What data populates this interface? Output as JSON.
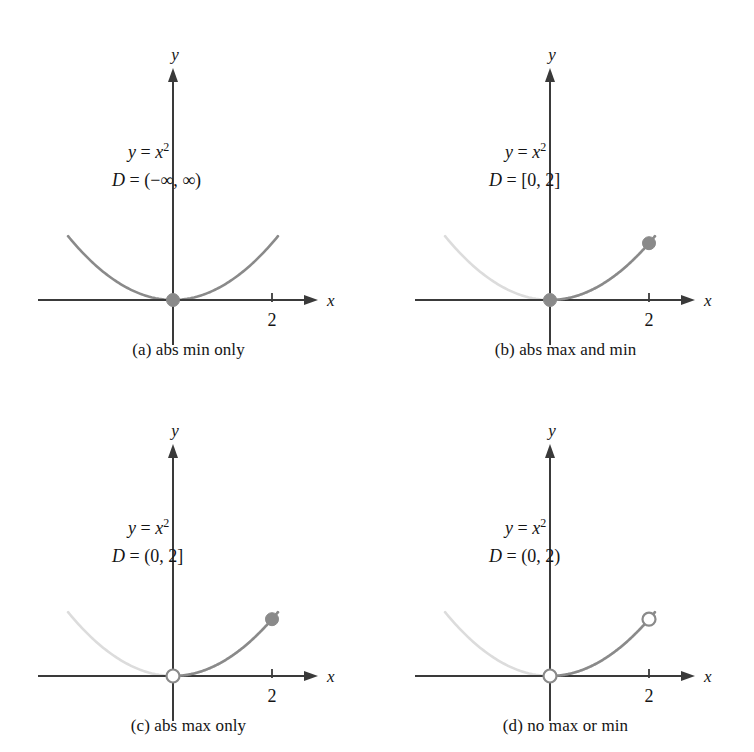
{
  "figure": {
    "columns": 2,
    "rows": 2,
    "background": "#ffffff",
    "panel_width": 377,
    "panel_height": 376
  },
  "style": {
    "curve_active_color": "#8a8a8a",
    "curve_inactive_color": "#dcdcdc",
    "axis_color": "#3a3a3a",
    "dot_fill_color": "#8a8a8a",
    "dot_open_fill": "#ffffff",
    "text_color": "#141414",
    "curve_width": 2.6,
    "axis_width": 2.0,
    "dot_radius": 6.5
  },
  "geometry": {
    "origin_x": 173,
    "origin_y": 300,
    "unit_px": 49.5,
    "y_scale_px": 14.2,
    "x_axis_left": 38,
    "x_axis_right": 318,
    "y_axis_top": 68,
    "y_axis_bottom": 345,
    "tick_x_value": 2,
    "curve_x_min": -2.12,
    "curve_x_max": 2.12
  },
  "labels": {
    "x_axis": "x",
    "y_axis": "y",
    "tick_2": "2",
    "equation_lhs": "y",
    "equation_eq": "=",
    "equation_rhs_base": "x",
    "equation_rhs_exp": "2",
    "domain_lhs": "D",
    "domain_eq": "="
  },
  "panels": [
    {
      "id": "a",
      "caption": "(a) abs min only",
      "equation": "y = x²",
      "domain_text": "(−∞, ∞)",
      "domain_start": null,
      "domain_end": null,
      "highlight_all": true,
      "markers": [
        {
          "name": "origin-min-point",
          "x": 0,
          "y": 0,
          "kind": "filled"
        }
      ]
    },
    {
      "id": "b",
      "caption": "(b) abs max and min",
      "equation": "y = x²",
      "domain_text": "[0, 2]",
      "domain_start": 0,
      "domain_end": 2,
      "highlight_all": false,
      "markers": [
        {
          "name": "origin-min-point",
          "x": 0,
          "y": 0,
          "kind": "filled"
        },
        {
          "name": "right-max-point",
          "x": 2,
          "y": 4,
          "kind": "filled"
        }
      ]
    },
    {
      "id": "c",
      "caption": "(c) abs max only",
      "equation": "y = x²",
      "domain_text": "(0, 2]",
      "domain_start": 0,
      "domain_end": 2,
      "highlight_all": false,
      "markers": [
        {
          "name": "origin-excluded-point",
          "x": 0,
          "y": 0,
          "kind": "open"
        },
        {
          "name": "right-max-point",
          "x": 2,
          "y": 4,
          "kind": "filled"
        }
      ]
    },
    {
      "id": "d",
      "caption": "(d) no max or min",
      "equation": "y = x²",
      "domain_text": "(0, 2)",
      "domain_start": 0,
      "domain_end": 2,
      "highlight_all": false,
      "markers": [
        {
          "name": "origin-excluded-point",
          "x": 0,
          "y": 0,
          "kind": "open"
        },
        {
          "name": "right-excluded-point",
          "x": 2,
          "y": 4,
          "kind": "open"
        }
      ]
    }
  ],
  "chart_data": {
    "type": "line",
    "function": "y = x^2",
    "xlabel": "x",
    "ylabel": "y",
    "xlim": [
      -2.12,
      2.12
    ],
    "ylim": [
      0,
      4.5
    ],
    "xticks": [
      2
    ],
    "xtick_labels": [
      "2"
    ],
    "yticks": [],
    "grid": false,
    "legend": null,
    "x": [
      -2.12,
      -1.8,
      -1.5,
      -1.2,
      -0.9,
      -0.6,
      -0.3,
      0,
      0.3,
      0.6,
      0.9,
      1.2,
      1.5,
      1.8,
      2.12
    ],
    "series": [
      {
        "name": "y = x^2",
        "values": [
          4.49,
          3.24,
          2.25,
          1.44,
          0.81,
          0.36,
          0.09,
          0,
          0.09,
          0.36,
          0.81,
          1.44,
          2.25,
          3.24,
          4.49
        ]
      }
    ],
    "panels": [
      {
        "id": "a",
        "domain": "(-inf, inf)",
        "highlighted_x_range": [
          -2.12,
          2.12
        ],
        "abs_min": {
          "x": 0,
          "y": 0
        },
        "abs_max": null,
        "caption": "(a) abs min only"
      },
      {
        "id": "b",
        "domain": "[0, 2]",
        "highlighted_x_range": [
          0,
          2
        ],
        "abs_min": {
          "x": 0,
          "y": 0
        },
        "abs_max": {
          "x": 2,
          "y": 4
        },
        "caption": "(b) abs max and min"
      },
      {
        "id": "c",
        "domain": "(0, 2]",
        "highlighted_x_range": [
          0,
          2
        ],
        "abs_min": null,
        "abs_max": {
          "x": 2,
          "y": 4
        },
        "caption": "(c) abs max only"
      },
      {
        "id": "d",
        "domain": "(0, 2)",
        "highlighted_x_range": [
          0,
          2
        ],
        "abs_min": null,
        "abs_max": null,
        "caption": "(d) no max or min"
      }
    ]
  }
}
